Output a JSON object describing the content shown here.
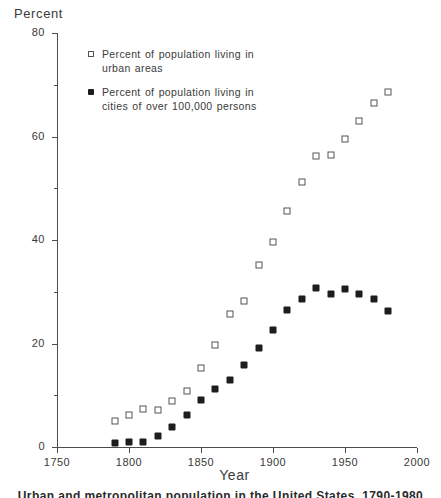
{
  "chart_data": {
    "type": "scatter",
    "title": "",
    "xlabel": "Year",
    "ylabel": "Percent",
    "xlim": [
      1750,
      2000
    ],
    "ylim": [
      0,
      80
    ],
    "grid": false,
    "legend_position": "upper-left-inside",
    "x_ticks": [
      1750,
      1800,
      1850,
      1900,
      1950,
      2000
    ],
    "x_tick_labels": [
      "1750",
      "1800",
      "1850",
      "1900",
      "1950",
      "2000"
    ],
    "y_ticks": [
      0,
      20,
      40,
      60,
      80
    ],
    "y_tick_labels": [
      "0",
      "20",
      "40",
      "60",
      "80"
    ],
    "y_minor_ticks": [
      10,
      30,
      50,
      70
    ],
    "series": [
      {
        "name": "Percent of population living in urban areas",
        "marker": "open-square",
        "color": "#545454",
        "points": [
          [
            1790,
            5.1
          ],
          [
            1800,
            6.1
          ],
          [
            1810,
            7.3
          ],
          [
            1820,
            7.2
          ],
          [
            1830,
            8.8
          ],
          [
            1840,
            10.8
          ],
          [
            1850,
            15.3
          ],
          [
            1860,
            19.8
          ],
          [
            1870,
            25.7
          ],
          [
            1880,
            28.2
          ],
          [
            1890,
            35.1
          ],
          [
            1900,
            39.6
          ],
          [
            1910,
            45.7
          ],
          [
            1920,
            51.2
          ],
          [
            1930,
            56.2
          ],
          [
            1940,
            56.5
          ],
          [
            1950,
            59.6
          ],
          [
            1960,
            63.0
          ],
          [
            1970,
            66.4
          ],
          [
            1980,
            68.6
          ]
        ]
      },
      {
        "name": "Percent of population living in cities of over 100,000 persons",
        "marker": "filled-diamond",
        "color": "#1d1d1d",
        "points": [
          [
            1790,
            0.8
          ],
          [
            1800,
            0.9
          ],
          [
            1810,
            1.0
          ],
          [
            1820,
            2.2
          ],
          [
            1830,
            3.8
          ],
          [
            1840,
            6.1
          ],
          [
            1850,
            9.1
          ],
          [
            1860,
            11.2
          ],
          [
            1870,
            13.0
          ],
          [
            1880,
            15.8
          ],
          [
            1890,
            19.2
          ],
          [
            1900,
            22.6
          ],
          [
            1910,
            26.4
          ],
          [
            1920,
            28.6
          ],
          [
            1930,
            30.8
          ],
          [
            1940,
            29.6
          ],
          [
            1950,
            30.6
          ],
          [
            1960,
            29.5
          ],
          [
            1970,
            28.6
          ],
          [
            1980,
            26.3
          ]
        ]
      }
    ]
  },
  "axis": {
    "y_title": "Percent",
    "x_title": "Year"
  },
  "legend": {
    "items": [
      {
        "marker": "open-square",
        "line1": "Percent of population living in",
        "line2": "urban areas"
      },
      {
        "marker": "filled-diamond",
        "line1": "Percent of population living in",
        "line2": "cities of over 100,000 persons"
      }
    ]
  },
  "caption": {
    "text": "Urban and metropolitan population in the United States, 1790-1980"
  }
}
